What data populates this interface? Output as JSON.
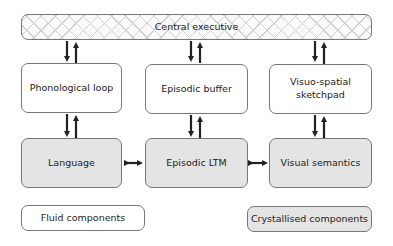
{
  "central_executive": {
    "label": "Central executive"
  },
  "fluid": [
    {
      "label": "Phonological loop"
    },
    {
      "label": "Episodic buffer"
    },
    {
      "label": "Visuo-spatial sketchpad"
    }
  ],
  "crystallised": [
    {
      "label": "Language"
    },
    {
      "label": "Episodic LTM"
    },
    {
      "label": "Visual semantics"
    }
  ],
  "legend": {
    "fluid_label": "Fluid components",
    "crystallised_label": "Crystallised components"
  },
  "colors": {
    "crystallised_fill": "#e4e4e4",
    "arrow": "#222222",
    "border": "#777777"
  }
}
